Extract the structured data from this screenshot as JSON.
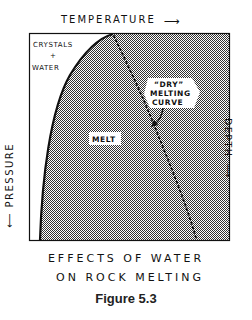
{
  "diagram": {
    "title_lines": [
      "EFFECTS OF WATER",
      "ON ROCK MELTING"
    ],
    "figure_label": "Figure 5.3",
    "axes": {
      "top": {
        "label": "TEMPERATURE",
        "arrow": "⟶"
      },
      "left": {
        "label": "PRESSURE",
        "arrow": "⟵"
      },
      "right": {
        "label": "DEPTH",
        "arrow": "⟵"
      }
    },
    "regions": {
      "crystals_water": {
        "line1": "CRYSTALS",
        "line2": "+",
        "line3": "WATER"
      },
      "melt": "MELT"
    },
    "annotation": {
      "line1": "“DRY”",
      "line2": "MELTING",
      "line3": "CURVE"
    },
    "colors": {
      "ink": "#111111",
      "fill_stipple": "#9a9a9a",
      "background": "#ffffff"
    }
  }
}
